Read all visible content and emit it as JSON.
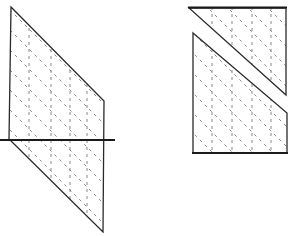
{
  "figure": {
    "colors": {
      "stroke": "#2a2a2a",
      "hatch": "#7a7a7a",
      "background": "#ffffff"
    },
    "left_figure": {
      "shape": "parallelogram",
      "vertices": [
        [
          11,
          7
        ],
        [
          104,
          101
        ],
        [
          103,
          232
        ],
        [
          9,
          139
        ]
      ],
      "cut_line": {
        "from": [
          0,
          140
        ],
        "to": [
          115,
          140
        ]
      },
      "vertical_dashes_x": [
        27,
        52,
        70,
        87
      ],
      "diagonal_dash_offsets": [
        20,
        40,
        60,
        80,
        100,
        120,
        140,
        160,
        180
      ]
    },
    "right_figure": {
      "shape": "rectangle split into two pieces",
      "top_piece": {
        "vertices": [
          [
            189,
            8
          ],
          [
            286,
            8
          ],
          [
            286,
            95
          ]
        ]
      },
      "bottom_piece": {
        "vertices": [
          [
            193,
            33
          ],
          [
            287,
            113
          ],
          [
            287,
            153
          ],
          [
            193,
            153
          ]
        ]
      },
      "vertical_dashes_x": [
        212,
        232,
        252,
        271
      ],
      "diagonal_dash_offsets": [
        20,
        40,
        60,
        80,
        100,
        120
      ]
    }
  }
}
